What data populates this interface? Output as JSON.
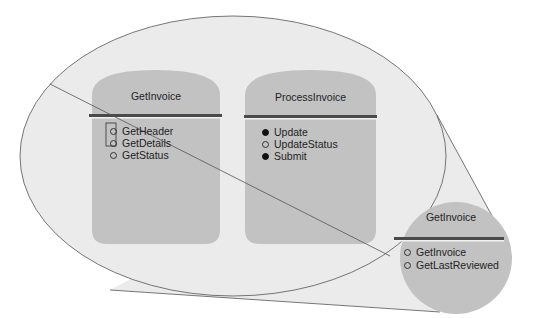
{
  "diagram": {
    "components": [
      {
        "name": "GetInvoice",
        "operations": [
          {
            "label": "GetHeader",
            "bullet": "open",
            "highlighted": true
          },
          {
            "label": "GetDetails",
            "bullet": "open",
            "highlighted": true
          },
          {
            "label": "GetStatus",
            "bullet": "open",
            "highlighted": false
          }
        ]
      },
      {
        "name": "ProcessInvoice",
        "operations": [
          {
            "label": "Update",
            "bullet": "filled"
          },
          {
            "label": "UpdateStatus",
            "bullet": "open"
          },
          {
            "label": "Submit",
            "bullet": "filled"
          }
        ]
      }
    ],
    "callout": {
      "name": "GetInvoice",
      "operations": [
        {
          "label": "GetInvoice",
          "bullet": "open"
        },
        {
          "label": "GetLastReviewed",
          "bullet": "open"
        }
      ]
    },
    "colors": {
      "ellipse_fill": "#ebebeb",
      "component_fill": "#c2c2c2",
      "separator": "#4a4a4a",
      "line": "#555555"
    }
  }
}
